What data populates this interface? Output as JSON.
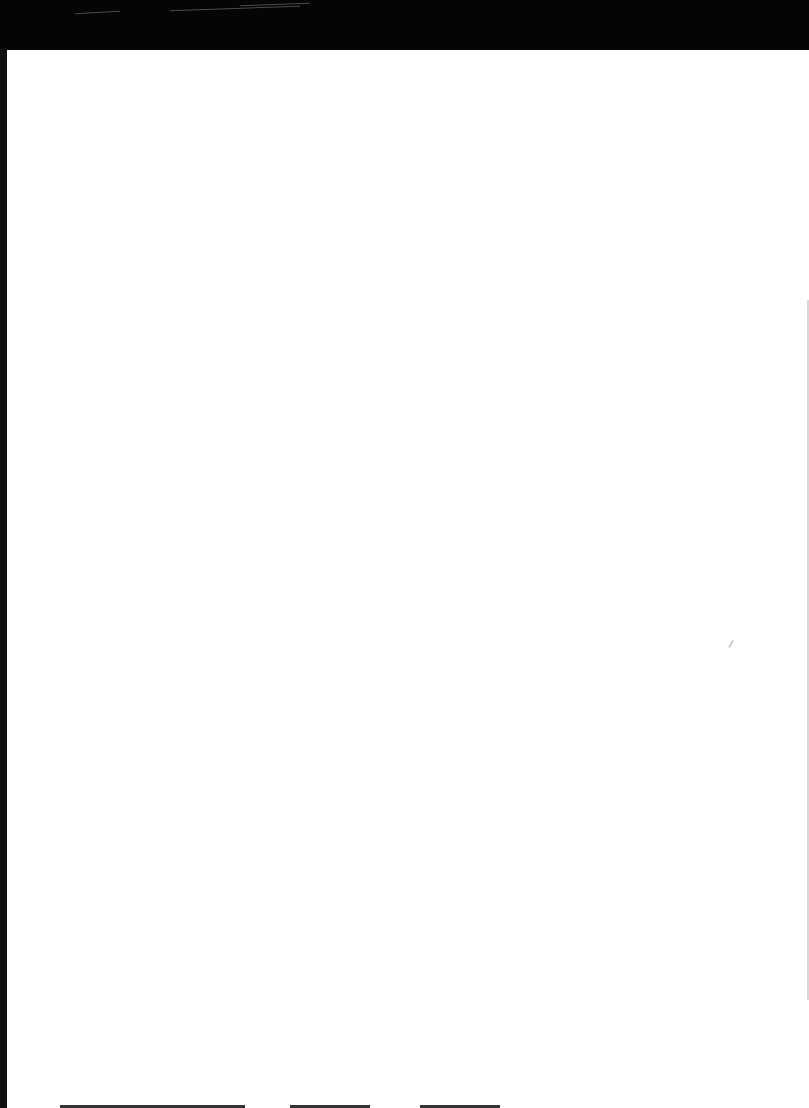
{
  "document": {
    "type": "scanned blank page",
    "text": "",
    "colors": {
      "band": "#050505",
      "paper": "#ffffff"
    }
  }
}
